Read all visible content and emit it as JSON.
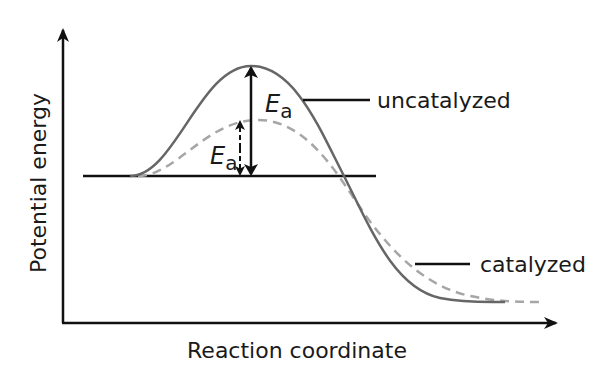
{
  "diagram": {
    "type": "energy_profile",
    "title": "",
    "axes": {
      "x_label": "Reaction coordinate",
      "y_label": "Potential energy"
    },
    "curves": [
      {
        "name": "uncatalyzed",
        "label": "uncatalyzed",
        "style": "solid",
        "color": "#666666"
      },
      {
        "name": "catalyzed",
        "label": "catalyzed",
        "style": "dashed",
        "color": "#a6a6a6"
      }
    ],
    "annotations": {
      "ea_uncatalyzed": {
        "symbol": "E",
        "subscript": "a"
      },
      "ea_catalyzed": {
        "symbol": "E",
        "subscript": "a"
      }
    },
    "reactant_level_line": true,
    "colors": {
      "axes": "#111111",
      "uncatalyzed_curve": "#666666",
      "catalyzed_curve": "#a6a6a6",
      "text": "#1a1a1a"
    }
  }
}
